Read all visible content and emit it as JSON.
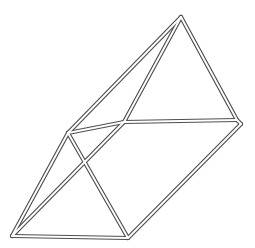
{
  "figure": {
    "shape_type": "triangular-prism",
    "render_style": "wireframe-tube-outline",
    "canvas": {
      "width": 255,
      "height": 248,
      "background": "#ffffff"
    },
    "stroke": {
      "color": "#4e4e52",
      "inner_color": "#ffffff",
      "outer_width": 4.2,
      "inner_width": 1.9
    },
    "vertices": [
      {
        "id": "apex-top",
        "label": "A",
        "x": 181,
        "y": 17
      },
      {
        "id": "right-back",
        "label": "B",
        "x": 237,
        "y": 120
      },
      {
        "id": "right-front",
        "label": "C",
        "x": 241,
        "y": 124
      },
      {
        "id": "mid-front",
        "label": "D",
        "x": 124,
        "y": 122
      },
      {
        "id": "left-back",
        "label": "E",
        "x": 68,
        "y": 133
      },
      {
        "id": "bottom-left",
        "label": "F",
        "x": 12,
        "y": 236
      },
      {
        "id": "bottom-mid",
        "label": "G",
        "x": 128,
        "y": 238
      }
    ],
    "edges": [
      {
        "id": "edge-apex-to-right-back",
        "from": "apex-top",
        "to": "right-back",
        "points": "181,17 237,120"
      },
      {
        "id": "edge-apex-to-mid-front",
        "from": "apex-top",
        "to": "mid-front",
        "points": "181,17 124,122"
      },
      {
        "id": "edge-apex-to-left-back",
        "from": "apex-top",
        "to": "left-back",
        "points": "181,17 68,133"
      },
      {
        "id": "edge-mid-front-to-right-back",
        "from": "mid-front",
        "to": "right-back",
        "points": "124,122 237,120"
      },
      {
        "id": "edge-right-back-to-right-front",
        "from": "right-back",
        "to": "right-front",
        "points": "237,120 241,124"
      },
      {
        "id": "edge-left-back-to-mid-front",
        "from": "left-back",
        "to": "mid-front",
        "points": "68,133 124,122"
      },
      {
        "id": "edge-left-back-to-bottom-left",
        "from": "left-back",
        "to": "bottom-left",
        "points": "68,133 12,236"
      },
      {
        "id": "edge-left-back-to-bottom-mid",
        "from": "left-back",
        "to": "bottom-mid",
        "points": "68,133 128,238"
      },
      {
        "id": "edge-bottom-left-to-mid-front",
        "from": "bottom-left",
        "to": "mid-front",
        "points": "12,236 124,122"
      },
      {
        "id": "edge-bottom-left-to-bottom-mid",
        "from": "bottom-left",
        "to": "bottom-mid",
        "points": "12,236 128,238"
      },
      {
        "id": "edge-bottom-mid-to-right-front",
        "from": "bottom-mid",
        "to": "right-front",
        "points": "128,238 241,124"
      }
    ]
  }
}
